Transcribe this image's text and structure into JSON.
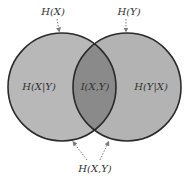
{
  "diagram": {
    "type": "venn",
    "colors": {
      "left_fill": "#b8b8b8",
      "right_fill": "#b3b3b3",
      "overlap_fill": "#8a8a8a",
      "stroke": "#2a2a2a",
      "arrow": "#7a7a7a",
      "text": "#333333"
    },
    "labels": {
      "hx": "H(X)",
      "hy": "H(Y)",
      "hx_given_y": "H(X|Y)",
      "mutual_info": "I(X,Y)",
      "hy_given_x": "H(Y|X)",
      "joint": "H(X,Y)"
    }
  }
}
